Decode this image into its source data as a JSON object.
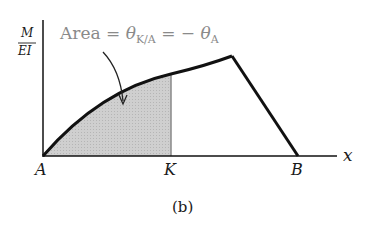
{
  "figure": {
    "caption": "(b)",
    "y_axis_label_num": "M",
    "y_axis_label_den": "EI",
    "x_axis_label": "x",
    "points": {
      "A": "A",
      "K": "K",
      "B": "B"
    },
    "annotation": {
      "prefix": "Area = ",
      "theta1": "θ",
      "sub1": "K/A",
      "mid": " = − ",
      "theta2": "θ",
      "sub2": "A"
    },
    "colors": {
      "line": "#111111",
      "shade": "#c8c8c8",
      "annotation": "#8a8a8a"
    }
  }
}
